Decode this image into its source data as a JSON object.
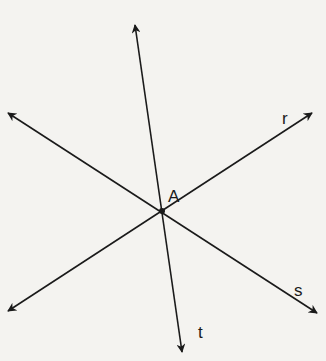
{
  "diagram": {
    "point": {
      "label": "A",
      "x": 162,
      "y": 211
    },
    "lines": [
      {
        "name": "t",
        "from": [
          135,
          25
        ],
        "to": [
          182,
          352
        ],
        "label_pos": [
          198,
          338
        ]
      },
      {
        "name": "r",
        "from": [
          8,
          311
        ],
        "to": [
          312,
          113
        ],
        "label_pos": [
          282,
          124
        ]
      },
      {
        "name": "s",
        "from": [
          8,
          113
        ],
        "to": [
          317,
          313
        ],
        "label_pos": [
          294,
          296
        ]
      }
    ],
    "labels": {
      "point": "A",
      "t": "t",
      "r": "r",
      "s": "s"
    },
    "colors": {
      "line": "#1a1a1a",
      "background": "#f4f3f0"
    }
  }
}
